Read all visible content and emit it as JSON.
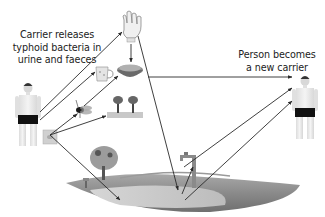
{
  "labels": {
    "carrier": {
      "line1": "Carrier releases",
      "line2": "typhoid bacteria in",
      "line3": "urine and faeces"
    },
    "new_carrier": {
      "line1": "Person becomes",
      "line2": "a new carrier"
    }
  },
  "nodes": [
    {
      "id": "carrier",
      "name": "Carrier person"
    },
    {
      "id": "faeces",
      "name": "Faeces / urine"
    },
    {
      "id": "hand",
      "name": "Hands"
    },
    {
      "id": "cup",
      "name": "Cup / drink"
    },
    {
      "id": "food",
      "name": "Food bowl"
    },
    {
      "id": "fly",
      "name": "Fly"
    },
    {
      "id": "crops",
      "name": "Crops"
    },
    {
      "id": "water",
      "name": "Water source / land"
    },
    {
      "id": "tap",
      "name": "Tap"
    },
    {
      "id": "new_carrier",
      "name": "New carrier person"
    }
  ],
  "edges": [
    {
      "from": "carrier",
      "to": "hand"
    },
    {
      "from": "carrier",
      "to": "cup"
    },
    {
      "from": "hand",
      "to": "food"
    },
    {
      "from": "faeces",
      "to": "fly"
    },
    {
      "from": "faeces",
      "to": "crops"
    },
    {
      "from": "faeces",
      "to": "water"
    },
    {
      "from": "fly",
      "to": "food"
    },
    {
      "from": "food",
      "to": "new_carrier"
    },
    {
      "from": "hand",
      "to": "water"
    },
    {
      "from": "water",
      "to": "tap"
    },
    {
      "from": "tap",
      "to": "new_carrier"
    },
    {
      "from": "water",
      "to": "new_carrier"
    }
  ],
  "colors": {
    "arrow": "#2a2a2a",
    "text": "#222222",
    "skin": "#e8e8e8",
    "shorts": "#111111",
    "land": "#8c8c8c",
    "water": "#c8c8c8"
  }
}
